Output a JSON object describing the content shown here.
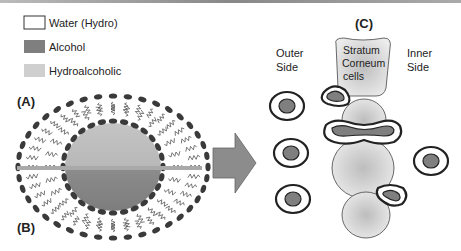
{
  "legend": {
    "items": [
      {
        "label": "Water (Hydro)",
        "color": "#ffffff"
      },
      {
        "label": "Alcohol",
        "color": "#7f7f7f"
      },
      {
        "label": "Hydroalcoholic",
        "color": "#cfcfcf"
      }
    ]
  },
  "panels": {
    "a_label": "(A)",
    "b_label": "(B)",
    "c_label": "(C)"
  },
  "skin": {
    "outer_side_line1": "Outer",
    "outer_side_line2": "Side",
    "inner_side_line1": "Inner",
    "inner_side_line2": "Side",
    "cells_line1": "Stratum",
    "cells_line2": "Corneum",
    "cells_line3": "cells"
  },
  "colors": {
    "alcohol": "#7f7f7f",
    "hydroalcoholic": "#cfcfcf",
    "bar": "#a9a9a9",
    "outline": "#222222"
  }
}
